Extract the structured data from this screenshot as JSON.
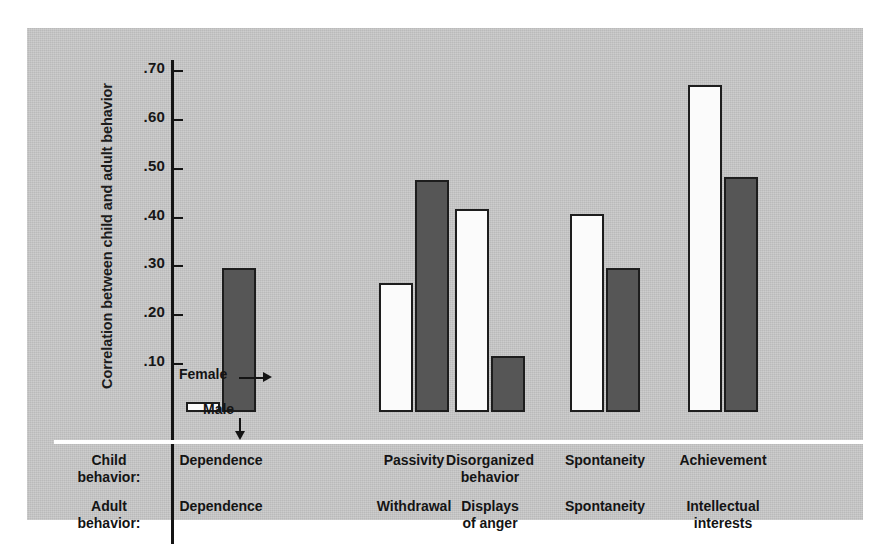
{
  "figure": {
    "y_axis_label": "Correlation between child and adult behavior",
    "tick_labels": [
      ".70",
      ".60",
      ".50",
      ".40",
      ".30",
      ".20",
      ".10"
    ],
    "tick_values": [
      0.7,
      0.6,
      0.5,
      0.4,
      0.3,
      0.2,
      0.1
    ],
    "row_label_child": "Child\nbehavior:",
    "row_label_child_line1": "Child",
    "row_label_child_line2": "behavior:",
    "row_label_adult_line1": "Adult",
    "row_label_adult_line2": "behavior:",
    "annotation_female": "Female",
    "annotation_male": "Male",
    "panel_color": "#c9c9c9",
    "male_bar_color": "#fbfbfb",
    "female_bar_color": "#565656",
    "axis_color": "#141414"
  },
  "chart_data": {
    "type": "bar",
    "title": "",
    "xlabel": "",
    "ylabel": "Correlation between child and adult behavior",
    "ylim": [
      0,
      0.75
    ],
    "grid": false,
    "legend_position": "inline-annotation",
    "categories": [
      "Dependence",
      "Passivity",
      "Disorganized behavior",
      "Spontaneity",
      "Achievement"
    ],
    "adult_categories": [
      "Dependence",
      "Withdrawal",
      "Displays of anger",
      "Spontaneity",
      "Intellectual interests"
    ],
    "child_labels": [
      {
        "line1": "Dependence",
        "line2": ""
      },
      {
        "line1": "Passivity",
        "line2": ""
      },
      {
        "line1": "Disorganized",
        "line2": "behavior"
      },
      {
        "line1": "Spontaneity",
        "line2": ""
      },
      {
        "line1": "Achievement",
        "line2": ""
      }
    ],
    "adult_labels": [
      {
        "line1": "Dependence",
        "line2": ""
      },
      {
        "line1": "Withdrawal",
        "line2": ""
      },
      {
        "line1": "Displays",
        "line2": "of anger"
      },
      {
        "line1": "Spontaneity",
        "line2": ""
      },
      {
        "line1": "Intellectual",
        "line2": "interests"
      }
    ],
    "series": [
      {
        "name": "Male",
        "values": [
          0.02,
          0.265,
          0.415,
          0.405,
          0.67
        ]
      },
      {
        "name": "Female",
        "values": [
          0.295,
          0.475,
          0.115,
          0.295,
          0.48
        ]
      }
    ]
  }
}
